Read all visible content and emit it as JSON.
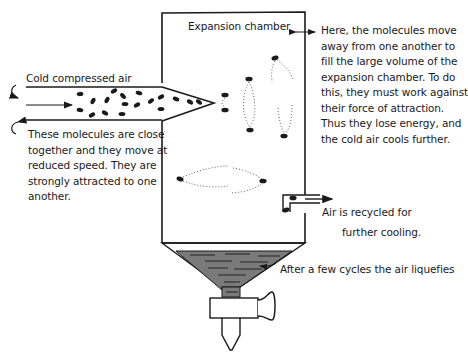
{
  "diagram": {
    "labels": {
      "expansion_chamber": "Expansion chamber",
      "cold_compressed_air": "Cold compressed air",
      "molecules_close_lines": [
        "These molecules are  close",
        "together and they move at",
        "reduced speed.  They are",
        "strongly attracted to one",
        "another."
      ],
      "expansion_explanation_lines": [
        "Here, the molecules move",
        "away from one another to",
        "fill the large volume of the",
        "expansion chamber. To do",
        "this, they must work against",
        "their force of attraction.",
        "Thus they lose energy, and",
        "the cold air cools further."
      ],
      "recycled_lines": [
        "Air is recycled  for",
        "further cooling."
      ],
      "liquefies": "After a few cycles the air liquefies"
    },
    "colors": {
      "line": "#1a1a1a",
      "liquid": "#7a7a7a",
      "background": "#ffffff"
    }
  }
}
